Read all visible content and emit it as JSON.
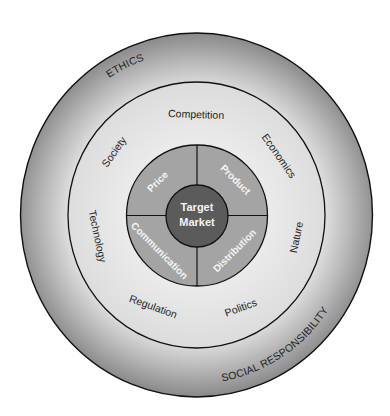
{
  "diagram": {
    "outer_ring": {
      "labels": [
        "ETHICS",
        "SOCIAL RESPONSIBILITY"
      ],
      "color_outer": "#8a8a8a",
      "color_inner": "#dadada"
    },
    "environment_ring": {
      "labels": {
        "competition": "Competition",
        "economics": "Economics",
        "nature": "Nature",
        "politics": "Politics",
        "regulation": "Regulation",
        "technology": "Technology",
        "society": "Society"
      },
      "color": "#e6e6e6"
    },
    "marketing_mix_ring": {
      "labels": {
        "price": "Price",
        "product": "Product",
        "distribution": "Distribution",
        "communication": "Communication"
      },
      "color": "#a3a3a3"
    },
    "center": {
      "line1": "Target",
      "line2": "Market",
      "color": "#5b5b5b"
    }
  }
}
